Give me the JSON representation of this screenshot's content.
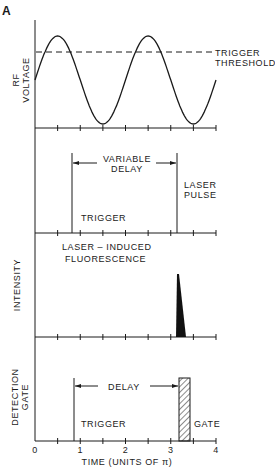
{
  "figure": {
    "panel_letter": "A",
    "x_axis": {
      "label": "TIME (UNITS OF π)",
      "tick_labels": [
        "0",
        "1",
        "2",
        "3",
        "4"
      ],
      "range": [
        0,
        4
      ],
      "minor_tick_step": 0.5
    },
    "panels": [
      {
        "id": "rf",
        "ylabel": [
          "RF",
          "VOLTAGE"
        ],
        "annotation": [
          "TRIGGER",
          "THRESHOLD"
        ]
      },
      {
        "id": "trigger-laser",
        "ylabel": [],
        "arrow_label": [
          "VARIABLE",
          "DELAY"
        ],
        "trigger_label": "TRIGGER",
        "pulse_label": [
          "LASER",
          "PULSE"
        ]
      },
      {
        "id": "intensity",
        "ylabel": [
          "INTENSITY"
        ],
        "annotation": [
          "LASER – INDUCED",
          "FLUORESCENCE"
        ]
      },
      {
        "id": "detection",
        "ylabel": [
          "DETECTION",
          "GATE"
        ],
        "arrow_label": [
          "DELAY"
        ],
        "trigger_label": "TRIGGER",
        "gate_label": "GATE"
      }
    ]
  },
  "chart_data": {
    "type": "line",
    "title": "",
    "xlabel": "TIME (UNITS OF π)",
    "xlim": [
      0,
      4
    ],
    "series": [
      {
        "name": "RF VOLTAGE",
        "kind": "sine",
        "period_pi": 2,
        "phase_start": "mid-rising",
        "x_start": 0,
        "x_end": 4
      },
      {
        "name": "TRIGGER THRESHOLD",
        "kind": "dashed-level",
        "level_fraction_of_amplitude": 0.6
      },
      {
        "name": "TRIGGER",
        "kind": "vertical-marker",
        "x": 0.8
      },
      {
        "name": "LASER PULSE",
        "kind": "vertical-marker",
        "x": 3.1
      },
      {
        "name": "LASER-INDUCED FLUORESCENCE",
        "kind": "decay-spike",
        "x_start": 3.1,
        "x_end": 3.3
      },
      {
        "name": "DETECTION GATE",
        "kind": "hatched-box",
        "x_start": 3.1,
        "x_end": 3.35
      }
    ]
  }
}
